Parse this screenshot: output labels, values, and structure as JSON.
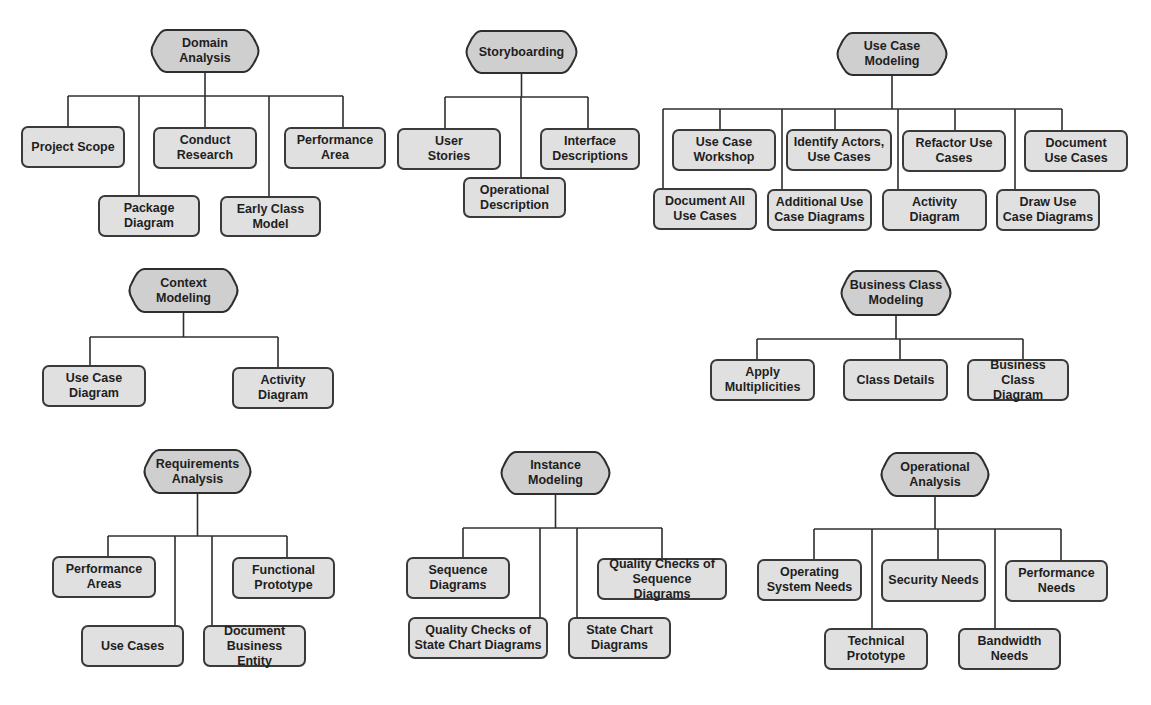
{
  "diagram": {
    "style": {
      "head_fill": "#cfcfcf",
      "leaf_fill": "#e0e0e0",
      "stroke": "#2e2e2e",
      "background": "#ffffff"
    },
    "groups": [
      {
        "id": "domain-analysis",
        "title": "Domain\nAnalysis",
        "head": {
          "x": 148,
          "y": 29,
          "w": 114,
          "h": 44
        },
        "bus_y": 96,
        "bus_x1": 68,
        "bus_x2": 343,
        "children": [
          {
            "label": "Project Scope",
            "x": 21,
            "y": 126,
            "w": 104,
            "h": 42,
            "stem_x": 68
          },
          {
            "label": "Package\nDiagram",
            "x": 98,
            "y": 195,
            "w": 102,
            "h": 42,
            "stem_x": 139
          },
          {
            "label": "Conduct\nResearch",
            "x": 153,
            "y": 127,
            "w": 104,
            "h": 42,
            "stem_x": 205
          },
          {
            "label": "Early Class\nModel",
            "x": 220,
            "y": 196,
            "w": 101,
            "h": 41,
            "stem_x": 269
          },
          {
            "label": "Performance\nArea",
            "x": 284,
            "y": 127,
            "w": 102,
            "h": 42,
            "stem_x": 343
          }
        ]
      },
      {
        "id": "storyboarding",
        "title": "Storyboarding",
        "head": {
          "x": 463,
          "y": 30,
          "w": 117,
          "h": 44
        },
        "bus_y": 97,
        "bus_x1": 445,
        "bus_x2": 588,
        "children": [
          {
            "label": "User\nStories",
            "x": 397,
            "y": 128,
            "w": 104,
            "h": 42,
            "stem_x": 445
          },
          {
            "label": "Operational\nDescription",
            "x": 463,
            "y": 177,
            "w": 103,
            "h": 41,
            "stem_x": 521
          },
          {
            "label": "Interface\nDescriptions",
            "x": 540,
            "y": 128,
            "w": 100,
            "h": 42,
            "stem_x": 588
          }
        ]
      },
      {
        "id": "use-case-modeling",
        "title": "Use Case\nModeling",
        "head": {
          "x": 834,
          "y": 32,
          "w": 116,
          "h": 44
        },
        "bus_y": 109,
        "bus_x1": 663,
        "bus_x2": 1062,
        "children": [
          {
            "label": "Document All\nUse Cases",
            "x": 653,
            "y": 188,
            "w": 104,
            "h": 42,
            "stem_x": 663
          },
          {
            "label": "Use Case\nWorkshop",
            "x": 672,
            "y": 129,
            "w": 104,
            "h": 42,
            "stem_x": 720
          },
          {
            "label": "Additional Use\nCase Diagrams",
            "x": 767,
            "y": 189,
            "w": 105,
            "h": 42,
            "stem_x": 782
          },
          {
            "label": "Identify Actors,\nUse Cases",
            "x": 786,
            "y": 129,
            "w": 106,
            "h": 42,
            "stem_x": 835
          },
          {
            "label": "Activity\nDiagram",
            "x": 882,
            "y": 189,
            "w": 105,
            "h": 42,
            "stem_x": 898
          },
          {
            "label": "Refactor Use\nCases",
            "x": 902,
            "y": 130,
            "w": 104,
            "h": 42,
            "stem_x": 955
          },
          {
            "label": "Draw Use\nCase Diagrams",
            "x": 996,
            "y": 189,
            "w": 104,
            "h": 42,
            "stem_x": 1015
          },
          {
            "label": "Document\nUse Cases",
            "x": 1024,
            "y": 130,
            "w": 104,
            "h": 42,
            "stem_x": 1062
          }
        ]
      },
      {
        "id": "context-modeling",
        "title": "Context\nModeling",
        "head": {
          "x": 126,
          "y": 268,
          "w": 115,
          "h": 45
        },
        "bus_y": 337,
        "bus_x1": 90,
        "bus_x2": 278,
        "children": [
          {
            "label": "Use Case\nDiagram",
            "x": 42,
            "y": 365,
            "w": 104,
            "h": 42,
            "stem_x": 90
          },
          {
            "label": "Activity\nDiagram",
            "x": 232,
            "y": 367,
            "w": 102,
            "h": 42,
            "stem_x": 278
          }
        ]
      },
      {
        "id": "business-class-modeling",
        "title": "Business Class\nModeling",
        "head": {
          "x": 838,
          "y": 270,
          "w": 116,
          "h": 46
        },
        "bus_y": 339,
        "bus_x1": 757,
        "bus_x2": 1023,
        "children": [
          {
            "label": "Apply\nMultiplicities",
            "x": 710,
            "y": 359,
            "w": 105,
            "h": 42,
            "stem_x": 757
          },
          {
            "label": "Class Details",
            "x": 843,
            "y": 359,
            "w": 105,
            "h": 42,
            "stem_x": 900
          },
          {
            "label": "Business Class\nDiagram",
            "x": 967,
            "y": 359,
            "w": 102,
            "h": 42,
            "stem_x": 1023
          }
        ]
      },
      {
        "id": "requirements-analysis",
        "title": "Requirements\nAnalysis",
        "head": {
          "x": 141,
          "y": 449,
          "w": 113,
          "h": 45
        },
        "bus_y": 536,
        "bus_x1": 108,
        "bus_x2": 287,
        "children": [
          {
            "label": "Performance\nAreas",
            "x": 52,
            "y": 556,
            "w": 104,
            "h": 42,
            "stem_x": 108
          },
          {
            "label": "Use Cases",
            "x": 81,
            "y": 625,
            "w": 103,
            "h": 42,
            "stem_x": 175
          },
          {
            "label": "Document\nBusiness Entity",
            "x": 203,
            "y": 625,
            "w": 103,
            "h": 42,
            "stem_x": 212
          },
          {
            "label": "Functional\nPrototype",
            "x": 232,
            "y": 557,
            "w": 103,
            "h": 42,
            "stem_x": 287
          }
        ]
      },
      {
        "id": "instance-modeling",
        "title": "Instance\nModeling",
        "head": {
          "x": 498,
          "y": 451,
          "w": 115,
          "h": 44
        },
        "bus_y": 528,
        "bus_x1": 463,
        "bus_x2": 662,
        "children": [
          {
            "label": "Sequence\nDiagrams",
            "x": 406,
            "y": 557,
            "w": 104,
            "h": 42,
            "stem_x": 463
          },
          {
            "label": "Quality Checks of\nState Chart Diagrams",
            "x": 408,
            "y": 617,
            "w": 140,
            "h": 42,
            "stem_x": 540
          },
          {
            "label": "State Chart\nDiagrams",
            "x": 568,
            "y": 617,
            "w": 103,
            "h": 42,
            "stem_x": 577
          },
          {
            "label": "Quality Checks of\nSequence Diagrams",
            "x": 597,
            "y": 558,
            "w": 130,
            "h": 42,
            "stem_x": 662
          }
        ]
      },
      {
        "id": "operational-analysis",
        "title": "Operational\nAnalysis",
        "head": {
          "x": 878,
          "y": 452,
          "w": 114,
          "h": 45
        },
        "bus_y": 529,
        "bus_x1": 814,
        "bus_x2": 1061,
        "children": [
          {
            "label": "Operating\nSystem Needs",
            "x": 757,
            "y": 559,
            "w": 105,
            "h": 42,
            "stem_x": 814
          },
          {
            "label": "Technical\nPrototype",
            "x": 824,
            "y": 628,
            "w": 104,
            "h": 42,
            "stem_x": 872
          },
          {
            "label": "Security Needs",
            "x": 881,
            "y": 559,
            "w": 105,
            "h": 43,
            "stem_x": 938
          },
          {
            "label": "Bandwidth\nNeeds",
            "x": 958,
            "y": 628,
            "w": 103,
            "h": 42,
            "stem_x": 995
          },
          {
            "label": "Performance\nNeeds",
            "x": 1005,
            "y": 560,
            "w": 103,
            "h": 42,
            "stem_x": 1061
          }
        ]
      }
    ]
  }
}
